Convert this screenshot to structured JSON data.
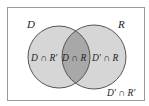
{
  "diagram": {
    "type": "venn",
    "universe_label": "",
    "sets": [
      {
        "name": "D",
        "label": "D"
      },
      {
        "name": "R",
        "label": "R"
      }
    ],
    "regions": {
      "d_only": "D ∩ R′",
      "intersection": "D ∩ R",
      "r_only": "D′ ∩ R",
      "outside": "D′ ∩ R′"
    },
    "colors": {
      "background": "#ffffff",
      "frame": "#9a9a9a",
      "circle_fill": "#d6d6d6",
      "intersection_fill": "#a8a8a8",
      "circle_stroke": "#555555",
      "text": "#222222"
    }
  }
}
